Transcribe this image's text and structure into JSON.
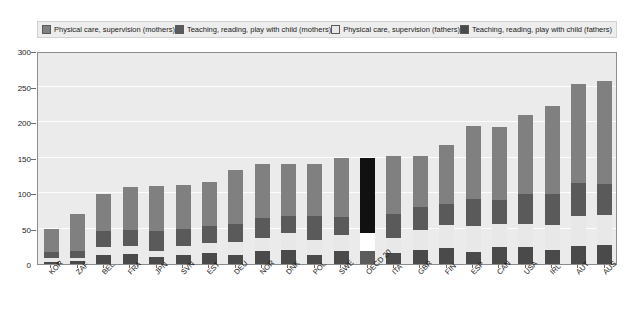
{
  "legend": {
    "items": [
      {
        "label": "Physical care, supervision (mothers)",
        "color": "#808080",
        "key": "mothers_physical"
      },
      {
        "label": "Teaching, reading, play with child (mothers)",
        "color": "#5a5a5a",
        "key": "mothers_teaching"
      },
      {
        "label": "Physical care, supervision (fathers)",
        "color": "#e8e8e8",
        "key": "fathers_physical"
      },
      {
        "label": "Teaching, reading, play with child (fathers)",
        "color": "#4a4a4a",
        "key": "fathers_teaching"
      }
    ]
  },
  "chart_data": {
    "type": "bar",
    "stacked": true,
    "title": "",
    "xlabel": "",
    "ylabel": "",
    "ylim": [
      0,
      300
    ],
    "yticks": [
      0,
      50,
      100,
      150,
      200,
      250,
      300
    ],
    "grid": true,
    "legend_position": "top",
    "highlight_category": "OECD 20",
    "highlight_color": "#111111",
    "categories": [
      "KOR",
      "ZAF",
      "BEL",
      "FRA",
      "JPN",
      "SVN",
      "EST",
      "DEU",
      "NOR",
      "DNK",
      "POL",
      "SWE",
      "OECD 20",
      "ITA",
      "GBR",
      "FIN",
      "ESP",
      "CAN",
      "USA",
      "IRL",
      "AUT",
      "AUS"
    ],
    "series": [
      {
        "name": "Teaching, reading, play with child (fathers)",
        "key": "fathers_teaching",
        "color": "#4a4a4a",
        "values": [
          3,
          4,
          12,
          14,
          10,
          13,
          15,
          13,
          19,
          20,
          12,
          19,
          18,
          15,
          20,
          23,
          17,
          24,
          24,
          20,
          26,
          27
        ]
      },
      {
        "name": "Physical care, supervision (fathers)",
        "key": "fathers_physical",
        "color": "#e8e8e8",
        "values": [
          5,
          5,
          12,
          11,
          9,
          13,
          15,
          18,
          18,
          23,
          22,
          22,
          26,
          22,
          28,
          32,
          37,
          33,
          32,
          35,
          42,
          42
        ]
      },
      {
        "name": "Teaching, reading, play with child (mothers)",
        "key": "mothers_teaching",
        "color": "#5a5a5a",
        "values": [
          9,
          10,
          22,
          23,
          27,
          23,
          24,
          26,
          28,
          25,
          33,
          25,
          32,
          33,
          32,
          30,
          37,
          33,
          43,
          43,
          46,
          44
        ]
      },
      {
        "name": "Physical care, supervision (mothers)",
        "key": "mothers_physical",
        "color": "#808080",
        "values": [
          32,
          52,
          53,
          61,
          64,
          63,
          61,
          75,
          76,
          73,
          74,
          84,
          74,
          82,
          72,
          82,
          103,
          103,
          111,
          125,
          140,
          145
        ]
      }
    ],
    "totals": [
      49,
      71,
      99,
      109,
      110,
      112,
      115,
      132,
      141,
      141,
      141,
      150,
      150,
      152,
      152,
      167,
      194,
      193,
      210,
      223,
      254,
      258
    ]
  }
}
